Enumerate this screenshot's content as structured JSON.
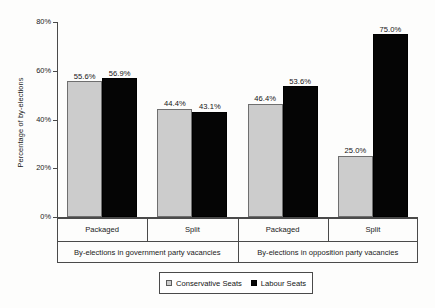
{
  "chart_data": {
    "type": "bar",
    "title": "",
    "xlabel": "",
    "ylabel": "Percentage of by-elections",
    "ylim": [
      0,
      80
    ],
    "yticks": [
      0,
      20,
      40,
      60,
      80
    ],
    "ytick_labels": [
      "0%",
      "20%",
      "40%",
      "60%",
      "80%"
    ],
    "grid": false,
    "legend_position": "bottom-center",
    "categories": [
      "Packaged",
      "Split",
      "Packaged",
      "Split"
    ],
    "group_labels": [
      "By-elections in government party vacancies",
      "By-elections in opposition party vacancies"
    ],
    "series": [
      {
        "name": "Conservative Seats",
        "color": "#cccccc",
        "values": [
          55.6,
          44.4,
          46.4,
          25.0
        ]
      },
      {
        "name": "Labour Seats",
        "color": "#050505",
        "values": [
          56.9,
          43.1,
          53.6,
          75.0
        ]
      }
    ],
    "value_labels": [
      [
        "55.6%",
        "44.4%",
        "46.4%",
        "25.0%"
      ],
      [
        "56.9%",
        "43.1%",
        "53.6%",
        "75.0%"
      ]
    ]
  },
  "legend": {
    "items": [
      {
        "label": "Conservative Seats",
        "swatch": "square-light-gray"
      },
      {
        "label": "Labour Seats",
        "swatch": "square-black"
      }
    ]
  }
}
